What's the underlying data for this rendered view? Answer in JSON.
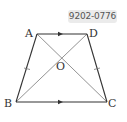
{
  "badge": {
    "code": "9202-0776"
  },
  "figure": {
    "type": "trapezoid",
    "points": {
      "A": {
        "label": "A",
        "x": 37,
        "y": 34
      },
      "D": {
        "label": "D",
        "x": 87,
        "y": 34
      },
      "B": {
        "label": "B",
        "x": 16,
        "y": 102
      },
      "C": {
        "label": "C",
        "x": 107,
        "y": 102
      },
      "O": {
        "label": "O",
        "x": 62,
        "y": 57
      }
    },
    "segments": [
      "AD",
      "BC",
      "AB",
      "DC",
      "AC",
      "BD"
    ],
    "parallel_marks": [
      "AD",
      "BC"
    ],
    "equal_marks": [
      "AB",
      "DC"
    ],
    "colors": {
      "sides": "#333333",
      "diagonals": "#777777"
    }
  }
}
